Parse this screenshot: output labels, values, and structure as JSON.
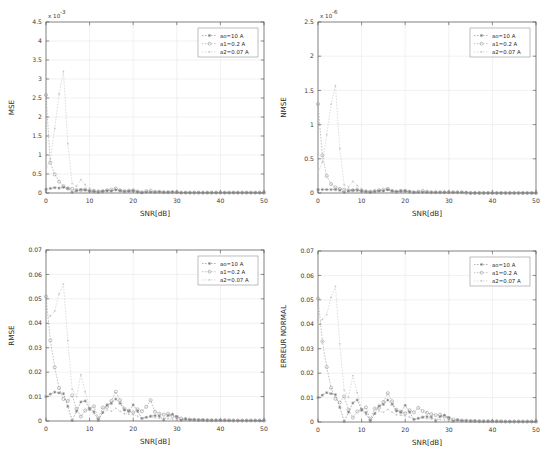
{
  "figure": {
    "background": "#ffffff",
    "panel_count": 4,
    "series_colors": [
      "#7a7a7a",
      "#9a9a9a",
      "#c6c6c6"
    ],
    "axis_color": "#4a4a4a",
    "grid_color": "#e2e2e2"
  },
  "legend_labels": {
    "s0": "ao=10 A",
    "s1": "a1=0.2 A",
    "s2": "a2=0.07 A"
  },
  "chart_data": [
    {
      "id": "mse",
      "type": "line",
      "title": "",
      "xlabel": "SNR[dB]",
      "ylabel": "MSE",
      "exponent_label": "x 10",
      "exponent_power": "-3",
      "y_scale": 0.001,
      "xlim": [
        0,
        50
      ],
      "ylim": [
        0,
        4.5
      ],
      "xticks": [
        0,
        10,
        20,
        30,
        40,
        50
      ],
      "xticklabels": [
        "0",
        "10",
        "20",
        "30",
        "40",
        "50"
      ],
      "yticks": [
        0,
        0.5,
        1,
        1.5,
        2,
        2.5,
        3,
        3.5,
        4,
        4.5
      ],
      "yticklabels": [
        "0",
        "0.5",
        "1",
        "1.5",
        "2",
        "2.5",
        "3",
        "3.5",
        "4",
        "4.5"
      ],
      "grid": true,
      "legend_position": "upper-right",
      "legend": [
        "ao=10 A",
        "a1=0.2 A",
        "a2=0.07 A"
      ],
      "x": [
        0,
        1,
        2,
        3,
        4,
        5,
        6,
        7,
        8,
        9,
        10,
        11,
        12,
        13,
        14,
        15,
        16,
        17,
        18,
        19,
        20,
        21,
        22,
        23,
        24,
        25,
        26,
        27,
        28,
        29,
        30,
        31,
        32,
        33,
        34,
        35,
        36,
        37,
        38,
        39,
        40,
        41,
        42,
        43,
        44,
        45,
        46,
        47,
        48,
        49,
        50
      ],
      "series": [
        {
          "name": "ao=10 A",
          "marker": "star",
          "values": [
            0.1,
            0.12,
            0.14,
            0.13,
            0.15,
            0.12,
            0.02,
            0.06,
            0.09,
            0.08,
            0.05,
            0.04,
            0.02,
            0.04,
            0.06,
            0.05,
            0.08,
            0.06,
            0.04,
            0.05,
            0.06,
            0.03,
            0.01,
            0.02,
            0.02,
            0.02,
            0.03,
            0.02,
            0.02,
            0.03,
            0.02,
            0.01,
            0.01,
            0.01,
            0.01,
            0.01,
            0.01,
            0.01,
            0.01,
            0.01,
            0.01,
            0.01,
            0.01,
            0.01,
            0.01,
            0.01,
            0.01,
            0.01,
            0.01,
            0.01,
            0.01
          ]
        },
        {
          "name": "a1=0.2 A",
          "marker": "circle",
          "values": [
            2.58,
            0.8,
            0.49,
            0.3,
            0.18,
            0.12,
            0.11,
            0.08,
            0.07,
            0.09,
            0.06,
            0.05,
            0.04,
            0.05,
            0.07,
            0.09,
            0.12,
            0.07,
            0.05,
            0.06,
            0.07,
            0.04,
            0.02,
            0.05,
            0.06,
            0.03,
            0.03,
            0.02,
            0.02,
            0.02,
            0.02,
            0.01,
            0.01,
            0.01,
            0.01,
            0.01,
            0.01,
            0.01,
            0.01,
            0.01,
            0.01,
            0.01,
            0.01,
            0.01,
            0.01,
            0.01,
            0.01,
            0.01,
            0.01,
            0.01,
            0.01
          ]
        },
        {
          "name": "a2=0.07 A",
          "marker": "dot",
          "values": [
            0.6,
            0.9,
            1.7,
            2.6,
            3.2,
            1.3,
            0.25,
            0.18,
            0.35,
            0.22,
            0.12,
            0.08,
            0.06,
            0.06,
            0.07,
            0.06,
            0.08,
            0.06,
            0.04,
            0.04,
            0.04,
            0.03,
            0.02,
            0.02,
            0.02,
            0.02,
            0.02,
            0.02,
            0.02,
            0.02,
            0.01,
            0.01,
            0.01,
            0.01,
            0.01,
            0.01,
            0.01,
            0.01,
            0.01,
            0.01,
            0.01,
            0.01,
            0.01,
            0.01,
            0.01,
            0.01,
            0.01,
            0.01,
            0.01,
            0.01,
            0.01
          ]
        }
      ]
    },
    {
      "id": "nmse",
      "type": "line",
      "title": "",
      "xlabel": "SNR[dB]",
      "ylabel": "NMSE",
      "exponent_label": "x 10",
      "exponent_power": "-6",
      "y_scale": 1e-06,
      "xlim": [
        0,
        50
      ],
      "ylim": [
        0,
        2.5
      ],
      "xticks": [
        0,
        10,
        20,
        30,
        40,
        50
      ],
      "xticklabels": [
        "0",
        "10",
        "20",
        "30",
        "40",
        "50"
      ],
      "yticks": [
        0,
        0.5,
        1,
        1.5,
        2,
        2.5
      ],
      "yticklabels": [
        "0",
        "0.5",
        "1",
        "1.5",
        "2",
        "2.5"
      ],
      "grid": true,
      "legend_position": "upper-right",
      "legend": [
        "ao=10 A",
        "a1=0.2 A",
        "a2=0.07 A"
      ],
      "x": [
        0,
        1,
        2,
        3,
        4,
        5,
        6,
        7,
        8,
        9,
        10,
        11,
        12,
        13,
        14,
        15,
        16,
        17,
        18,
        19,
        20,
        21,
        22,
        23,
        24,
        25,
        26,
        27,
        28,
        29,
        30,
        31,
        32,
        33,
        34,
        35,
        36,
        37,
        38,
        39,
        40,
        41,
        42,
        43,
        44,
        45,
        46,
        47,
        48,
        49,
        50
      ],
      "series": [
        {
          "name": "ao=10 A",
          "marker": "star",
          "values": [
            0.05,
            0.05,
            0.05,
            0.05,
            0.05,
            0.04,
            0.01,
            0.03,
            0.04,
            0.04,
            0.03,
            0.02,
            0.01,
            0.02,
            0.03,
            0.03,
            0.05,
            0.03,
            0.02,
            0.03,
            0.03,
            0.02,
            0.01,
            0.01,
            0.01,
            0.01,
            0.01,
            0.01,
            0.01,
            0.01,
            0.01,
            0.01,
            0.01,
            0.01,
            0.01,
            0.0,
            0.0,
            0.0,
            0.0,
            0.0,
            0.0,
            0.0,
            0.0,
            0.0,
            0.0,
            0.0,
            0.0,
            0.0,
            0.0,
            0.0,
            0.0
          ]
        },
        {
          "name": "a1=0.2 A",
          "marker": "circle",
          "values": [
            1.3,
            0.55,
            0.25,
            0.13,
            0.08,
            0.06,
            0.05,
            0.04,
            0.04,
            0.05,
            0.03,
            0.02,
            0.02,
            0.03,
            0.04,
            0.05,
            0.06,
            0.03,
            0.02,
            0.03,
            0.03,
            0.02,
            0.01,
            0.02,
            0.03,
            0.02,
            0.01,
            0.01,
            0.01,
            0.01,
            0.01,
            0.01,
            0.01,
            0.01,
            0.0,
            0.0,
            0.0,
            0.0,
            0.0,
            0.0,
            0.0,
            0.0,
            0.0,
            0.0,
            0.0,
            0.0,
            0.0,
            0.0,
            0.0,
            0.0,
            0.0
          ]
        },
        {
          "name": "a2=0.07 A",
          "marker": "dot",
          "values": [
            0.3,
            0.45,
            0.85,
            1.3,
            1.57,
            0.65,
            0.12,
            0.09,
            0.17,
            0.11,
            0.06,
            0.04,
            0.03,
            0.03,
            0.04,
            0.03,
            0.04,
            0.03,
            0.02,
            0.02,
            0.02,
            0.01,
            0.01,
            0.01,
            0.01,
            0.01,
            0.01,
            0.01,
            0.01,
            0.01,
            0.01,
            0.0,
            0.0,
            0.0,
            0.0,
            0.0,
            0.0,
            0.0,
            0.0,
            0.0,
            0.0,
            0.0,
            0.0,
            0.0,
            0.0,
            0.0,
            0.0,
            0.0,
            0.0,
            0.0,
            0.0
          ]
        }
      ]
    },
    {
      "id": "rmse",
      "type": "line",
      "title": "",
      "xlabel": "SNR[dB]",
      "ylabel": "RMSE",
      "exponent_label": "",
      "exponent_power": "",
      "y_scale": 1,
      "xlim": [
        0,
        50
      ],
      "ylim": [
        0,
        0.07
      ],
      "xticks": [
        0,
        10,
        20,
        30,
        40,
        50
      ],
      "xticklabels": [
        "0",
        "10",
        "20",
        "30",
        "40",
        "50"
      ],
      "yticks": [
        0,
        0.01,
        0.02,
        0.03,
        0.04,
        0.05,
        0.06,
        0.07
      ],
      "yticklabels": [
        "0",
        "0.01",
        "0.02",
        "0.03",
        "0.04",
        "0.05",
        "0.06",
        "0.07"
      ],
      "grid": true,
      "legend_position": "upper-right",
      "legend": [
        "ao=10 A",
        "a1=0.2 A",
        "a2=0.07 A"
      ],
      "x": [
        0,
        1,
        2,
        3,
        4,
        5,
        6,
        7,
        8,
        9,
        10,
        11,
        12,
        13,
        14,
        15,
        16,
        17,
        18,
        19,
        20,
        21,
        22,
        23,
        24,
        25,
        26,
        27,
        28,
        29,
        30,
        31,
        32,
        33,
        34,
        35,
        36,
        37,
        38,
        39,
        40,
        41,
        42,
        43,
        44,
        45,
        46,
        47,
        48,
        49,
        50
      ],
      "series": [
        {
          "name": "ao=10 A",
          "marker": "star",
          "values": [
            0.01,
            0.011,
            0.0118,
            0.0115,
            0.0112,
            0.006,
            0.0002,
            0.004,
            0.0078,
            0.0082,
            0.005,
            0.0038,
            0.0003,
            0.0035,
            0.0066,
            0.0072,
            0.009,
            0.0072,
            0.0045,
            0.004,
            0.0066,
            0.004,
            0.001,
            0.0015,
            0.002,
            0.0022,
            0.002,
            0.0004,
            0.0022,
            0.0028,
            0.0018,
            0.0003,
            0.0008,
            0.0005,
            0.0005,
            0.0004,
            0.0004,
            0.0003,
            0.0003,
            0.0003,
            0.0003,
            0.0003,
            0.0002,
            0.0002,
            0.0002,
            0.0002,
            0.0002,
            0.0002,
            0.0002,
            0.0002,
            0.0002
          ]
        },
        {
          "name": "a1=0.2 A",
          "marker": "circle",
          "values": [
            0.051,
            0.033,
            0.022,
            0.0135,
            0.009,
            0.0082,
            0.0105,
            0.005,
            0.0018,
            0.0043,
            0.005,
            0.006,
            0.001,
            0.0055,
            0.0058,
            0.0082,
            0.012,
            0.0085,
            0.005,
            0.0042,
            0.0035,
            0.0048,
            0.004,
            0.0058,
            0.0085,
            0.0038,
            0.003,
            0.0026,
            0.003,
            0.002,
            0.0016,
            0.001,
            0.0008,
            0.0006,
            0.0005,
            0.0004,
            0.0004,
            0.0003,
            0.0003,
            0.0003,
            0.0003,
            0.0003,
            0.0003,
            0.0002,
            0.0002,
            0.0002,
            0.0002,
            0.0002,
            0.0002,
            0.0002,
            0.0002
          ]
        },
        {
          "name": "a2=0.07 A",
          "marker": "dot",
          "values": [
            0.042,
            0.043,
            0.045,
            0.052,
            0.056,
            0.033,
            0.013,
            0.01,
            0.019,
            0.012,
            0.005,
            0.003,
            0.001,
            0.0032,
            0.0045,
            0.004,
            0.0052,
            0.004,
            0.003,
            0.0028,
            0.0026,
            0.002,
            0.0012,
            0.0015,
            0.0016,
            0.0014,
            0.0012,
            0.0012,
            0.001,
            0.0008,
            0.0006,
            0.0005,
            0.0004,
            0.0004,
            0.0003,
            0.0003,
            0.0003,
            0.0003,
            0.0002,
            0.0002,
            0.0002,
            0.0002,
            0.0002,
            0.0002,
            0.0002,
            0.0002,
            0.0002,
            0.0002,
            0.0002,
            0.0002,
            0.0002
          ]
        }
      ]
    },
    {
      "id": "erreur-normal",
      "type": "line",
      "title": "",
      "xlabel": "SNR[dB]",
      "ylabel": "ERREUR NORMAL",
      "exponent_label": "",
      "exponent_power": "",
      "y_scale": 1,
      "xlim": [
        0,
        50
      ],
      "ylim": [
        0,
        0.07
      ],
      "xticks": [
        0,
        10,
        20,
        30,
        40,
        50
      ],
      "xticklabels": [
        "0",
        "10",
        "20",
        "30",
        "40",
        "50"
      ],
      "yticks": [
        0,
        0.01,
        0.02,
        0.03,
        0.04,
        0.05,
        0.06,
        0.07
      ],
      "yticklabels": [
        "0",
        "0.01",
        "0.02",
        "0.03",
        "0.04",
        "0.05",
        "0.06",
        "0.07"
      ],
      "grid": true,
      "legend_position": "upper-right",
      "legend": [
        "ao=10 A",
        "a1=0.2 A",
        "a2=0.07 A"
      ],
      "x": [
        0,
        1,
        2,
        3,
        4,
        5,
        6,
        7,
        8,
        9,
        10,
        11,
        12,
        13,
        14,
        15,
        16,
        17,
        18,
        19,
        20,
        21,
        22,
        23,
        24,
        25,
        26,
        27,
        28,
        29,
        30,
        31,
        32,
        33,
        34,
        35,
        36,
        37,
        38,
        39,
        40,
        41,
        42,
        43,
        44,
        45,
        46,
        47,
        48,
        49,
        50
      ],
      "series": [
        {
          "name": "ao=10 A",
          "marker": "star",
          "values": [
            0.01,
            0.011,
            0.012,
            0.0116,
            0.0112,
            0.006,
            0.0002,
            0.004,
            0.0078,
            0.009,
            0.005,
            0.0038,
            0.0003,
            0.0035,
            0.0066,
            0.0072,
            0.009,
            0.0072,
            0.0045,
            0.004,
            0.0068,
            0.004,
            0.001,
            0.0015,
            0.002,
            0.0022,
            0.002,
            0.0004,
            0.0022,
            0.0028,
            0.0018,
            0.0003,
            0.0008,
            0.0005,
            0.0005,
            0.0004,
            0.0004,
            0.0003,
            0.0003,
            0.0003,
            0.0003,
            0.0003,
            0.0002,
            0.0002,
            0.0002,
            0.0002,
            0.0002,
            0.0002,
            0.0002,
            0.0002,
            0.0002
          ]
        },
        {
          "name": "a1=0.2 A",
          "marker": "circle",
          "values": [
            0.0505,
            0.033,
            0.0225,
            0.014,
            0.0095,
            0.008,
            0.0105,
            0.005,
            0.0018,
            0.0043,
            0.005,
            0.006,
            0.001,
            0.0055,
            0.0058,
            0.0082,
            0.0118,
            0.0085,
            0.005,
            0.0042,
            0.0035,
            0.0048,
            0.004,
            0.0058,
            0.0045,
            0.0038,
            0.0032,
            0.0028,
            0.003,
            0.0022,
            0.0016,
            0.001,
            0.0008,
            0.0006,
            0.0005,
            0.0004,
            0.0004,
            0.0003,
            0.0003,
            0.0003,
            0.0003,
            0.0003,
            0.0003,
            0.0002,
            0.0002,
            0.0002,
            0.0002,
            0.0002,
            0.0002,
            0.0002,
            0.0002
          ]
        },
        {
          "name": "a2=0.07 A",
          "marker": "dot",
          "values": [
            0.04,
            0.042,
            0.044,
            0.051,
            0.0555,
            0.032,
            0.013,
            0.01,
            0.019,
            0.012,
            0.005,
            0.003,
            0.001,
            0.0032,
            0.0045,
            0.004,
            0.0052,
            0.004,
            0.003,
            0.0028,
            0.0026,
            0.002,
            0.0012,
            0.0015,
            0.0016,
            0.0014,
            0.0012,
            0.0012,
            0.001,
            0.0008,
            0.0006,
            0.0005,
            0.0004,
            0.0004,
            0.0003,
            0.0003,
            0.0003,
            0.0003,
            0.0002,
            0.0002,
            0.0002,
            0.0002,
            0.0002,
            0.0002,
            0.0002,
            0.0002,
            0.0002,
            0.0002,
            0.0002,
            0.0002,
            0.0002
          ]
        }
      ]
    }
  ]
}
